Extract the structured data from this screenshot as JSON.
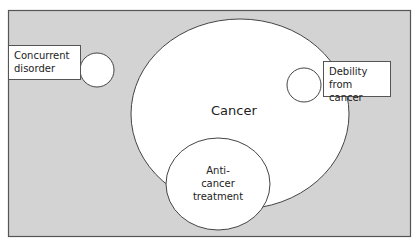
{
  "diagram": {
    "colors": {
      "background": "#d3d3d3",
      "frame_border": "#555555",
      "shape_fill": "#ffffff",
      "shape_stroke": "#444444"
    },
    "labels": {
      "cancer": "Cancer",
      "concurrent_disorder_line1": "Concurrent",
      "concurrent_disorder_line2": "disorder",
      "debility_line1": "Debility",
      "debility_line2": "from cancer",
      "treatment_line1": "Anti-",
      "treatment_line2": "cancer",
      "treatment_line3": "treatment"
    }
  }
}
